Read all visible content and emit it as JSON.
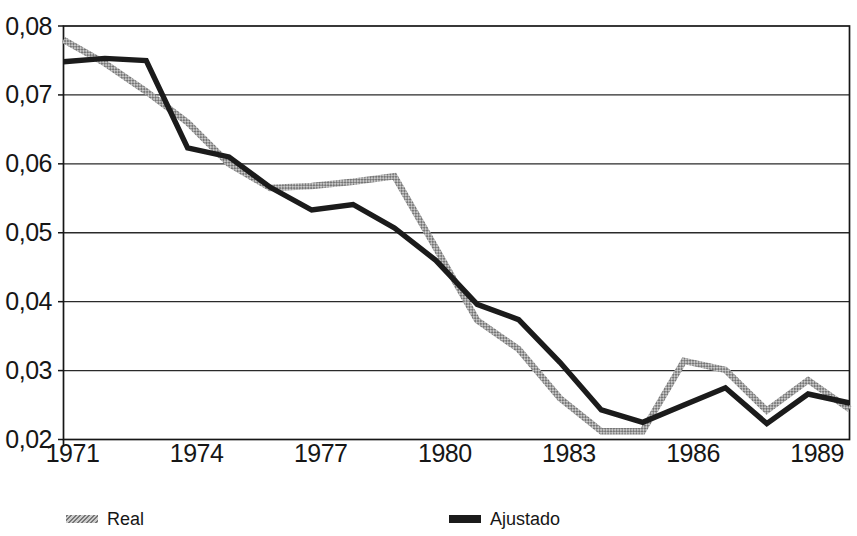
{
  "chart_data": {
    "type": "line",
    "title": "",
    "xlabel": "",
    "ylabel": "",
    "x": [
      1971,
      1972,
      1973,
      1974,
      1975,
      1976,
      1977,
      1978,
      1979,
      1980,
      1981,
      1982,
      1983,
      1984,
      1985,
      1986,
      1987,
      1988,
      1989,
      1990
    ],
    "x_tick_labels": [
      "1971",
      "1974",
      "1977",
      "1980",
      "1983",
      "1986",
      "1989"
    ],
    "x_tick_years": [
      1971,
      1974,
      1977,
      1980,
      1983,
      1986,
      1989
    ],
    "xlim": [
      1971,
      1990
    ],
    "y_ticks": [
      0.08,
      0.07,
      0.06,
      0.05,
      0.04,
      0.03,
      0.02
    ],
    "y_tick_labels": [
      "0,08",
      "0,07",
      "0,06",
      "0,05",
      "0,04",
      "0,03",
      "0,02"
    ],
    "ylim": [
      0.02,
      0.08
    ],
    "grid": "horizontal-only",
    "legend_position": "bottom",
    "series": [
      {
        "name": "Real",
        "style": "hatched-gray",
        "color": "#9a9a9a",
        "values": [
          0.078,
          0.0746,
          0.0705,
          0.066,
          0.06,
          0.0565,
          0.0568,
          0.0574,
          0.0582,
          0.0478,
          0.0373,
          0.0331,
          0.026,
          0.0212,
          0.0212,
          0.0314,
          0.0301,
          0.0242,
          0.0286,
          0.0244
        ]
      },
      {
        "name": "Ajustado",
        "style": "solid-black",
        "color": "#1b1b1b",
        "values": [
          0.0748,
          0.0753,
          0.075,
          0.0623,
          0.061,
          0.0566,
          0.0533,
          0.0541,
          0.0507,
          0.046,
          0.0396,
          0.0374,
          0.0312,
          0.0243,
          0.0225,
          0.025,
          0.0275,
          0.0223,
          0.0266,
          0.0253
        ]
      }
    ],
    "colors": {
      "ink": "#161616",
      "grid": "#2a2a2a",
      "hatch_dark": "#767676",
      "hatch_light": "#c9c9c9"
    }
  }
}
